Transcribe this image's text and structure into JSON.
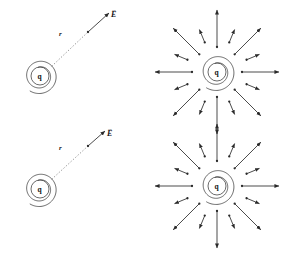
{
  "figure": {
    "background_color": "#ffffff",
    "stroke_color": "#2a2a2a",
    "dotted_color": "#9a9a9a",
    "panels": [
      {
        "id": "top-left",
        "type": "charge-with-field-vector",
        "charge_label": "q",
        "distance_label": "r",
        "field_label": "E",
        "field_label_has_vector_arrow": true,
        "charge_center": [
          40,
          76
        ],
        "outer_radius": 18,
        "inner_radius": 9,
        "dotted_line_from": [
          52,
          66
        ],
        "dotted_line_to": [
          88,
          32
        ],
        "arrow_from": [
          88,
          32
        ],
        "arrow_to": [
          109,
          13
        ],
        "r_label_pos": [
          59,
          34
        ],
        "E_label_pos": [
          111,
          13
        ]
      },
      {
        "id": "bottom-left",
        "type": "charge-with-field-vector",
        "charge_label": "q",
        "distance_label": "r",
        "field_label": "E",
        "field_label_has_vector_arrow": true,
        "charge_center": [
          40,
          189
        ],
        "outer_radius": 18,
        "inner_radius": 9,
        "dotted_line_from": [
          52,
          179
        ],
        "dotted_line_to": [
          88,
          146
        ],
        "arrow_from": [
          88,
          146
        ],
        "arrow_to": [
          105,
          131
        ],
        "r_label_pos": [
          59,
          148
        ],
        "E_label_pos": [
          108,
          132
        ]
      },
      {
        "id": "top-right",
        "type": "radial-field",
        "charge_label": "q",
        "charge_center": [
          217,
          72
        ],
        "outer_radius": 19,
        "inner_radius": 9,
        "long_arrow_start_radius": 25,
        "long_arrow_end_radius": 62,
        "short_arrow_start_radius": 32,
        "short_arrow_end_radius": 46,
        "long_arrow_count": 8,
        "short_arrow_count": 8,
        "long_arrow_angles_deg": [
          0,
          45,
          90,
          135,
          180,
          225,
          270,
          315
        ],
        "short_arrow_angles_deg": [
          22.5,
          67.5,
          112.5,
          157.5,
          202.5,
          247.5,
          292.5,
          337.5
        ]
      },
      {
        "id": "bottom-right",
        "type": "radial-field",
        "charge_label": "q",
        "charge_center": [
          217,
          186
        ],
        "outer_radius": 19,
        "inner_radius": 9,
        "long_arrow_start_radius": 25,
        "long_arrow_end_radius": 62,
        "short_arrow_start_radius": 32,
        "short_arrow_end_radius": 46,
        "long_arrow_count": 8,
        "short_arrow_count": 8,
        "long_arrow_angles_deg": [
          0,
          45,
          90,
          135,
          180,
          225,
          270,
          315
        ],
        "short_arrow_angles_deg": [
          22.5,
          67.5,
          112.5,
          157.5,
          202.5,
          247.5,
          292.5,
          337.5
        ]
      }
    ]
  }
}
